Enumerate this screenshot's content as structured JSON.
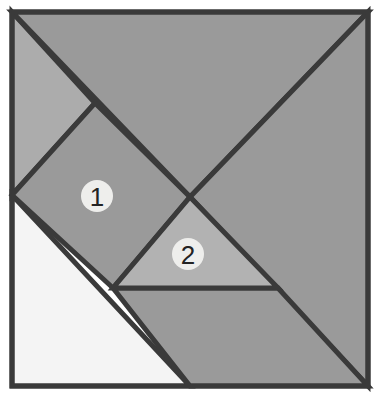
{
  "figure": {
    "name": "tangram-dissection-square",
    "background_color": "#ffffff",
    "outline_color": "#3a3a3a",
    "outline_width": 5,
    "square": {
      "left": 12,
      "top": 12,
      "right": 368,
      "bottom": 386
    }
  },
  "palette": {
    "light_gray": "#acacac",
    "medium_gray": "#9a9a9a",
    "pale_gray": "#b2b2b2",
    "white": "#f4f4f4",
    "stroke": "#3a3a3a",
    "label_disc": "#eeeeec",
    "label_text": "#232323"
  },
  "pieces": [
    {
      "id": "piece-top-left-triangle",
      "shape": "triangle",
      "fill": "#acacac",
      "points": "12,12 95,103 12,195"
    },
    {
      "id": "piece-top-large-triangle",
      "shape": "triangle",
      "fill": "#9a9a9a",
      "points": "12,12 368,12 190,197"
    },
    {
      "id": "piece-right-large-triangle",
      "shape": "triangle",
      "fill": "#9a9a9a",
      "points": "368,12 368,386 190,197"
    },
    {
      "id": "piece-square-one",
      "shape": "quadrilateral",
      "fill": "#9a9a9a",
      "points": "95,103 190,197 113,288 12,195"
    },
    {
      "id": "piece-medium-triangle-two",
      "shape": "triangle",
      "fill": "#b2b2b2",
      "points": "190,197 278,288 113,288"
    },
    {
      "id": "piece-bottom-parallelogram",
      "shape": "quadrilateral",
      "fill": "#9a9a9a",
      "points": "113,288 278,288 368,386 190,386"
    },
    {
      "id": "piece-bottom-left-white-triangle",
      "shape": "triangle",
      "fill": "#f4f4f4",
      "points": "12,195 190,386 12,386"
    }
  ],
  "labels": [
    {
      "id": "label-one",
      "text": "1",
      "cx": 97,
      "cy": 196,
      "r": 16
    },
    {
      "id": "label-two",
      "text": "2",
      "cx": 188,
      "cy": 254,
      "r": 16
    }
  ]
}
